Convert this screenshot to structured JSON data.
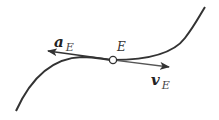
{
  "diagram": {
    "point_label": "E",
    "acceleration": {
      "symbol": "a",
      "subscript": "E"
    },
    "velocity": {
      "symbol": "v",
      "subscript": "E"
    },
    "colors": {
      "curve": "#333333",
      "arrow": "#333333",
      "point_fill": "#ffffff"
    }
  }
}
